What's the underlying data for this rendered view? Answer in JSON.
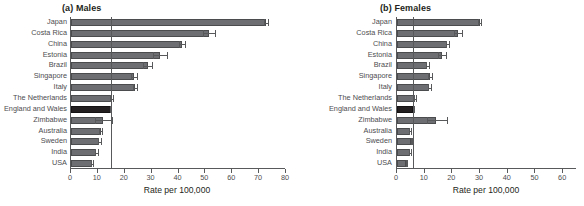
{
  "chart_data": {
    "type": "bar",
    "title": "",
    "orientation": "horizontal",
    "grid": false,
    "legend": null,
    "categories": [
      "Japan",
      "Costa Rica",
      "China",
      "Estonia",
      "Brazil",
      "Singapore",
      "Italy",
      "The Netherlands",
      "England and Wales",
      "Zimbabwe",
      "Australia",
      "Sweden",
      "India",
      "USA"
    ],
    "panels": [
      {
        "id": "a",
        "label": "(a) Males",
        "xlabel": "Rate per 100,000",
        "xlim": [
          0,
          80
        ],
        "xticks": [
          0,
          10,
          20,
          30,
          40,
          50,
          60,
          70,
          80
        ],
        "reference_line": 14.7,
        "highlight_category": "England and Wales",
        "values": [
          72.5,
          51.2,
          41.2,
          33.0,
          28.5,
          23.5,
          23.8,
          15.2,
          14.7,
          12.0,
          11.0,
          10.6,
          9.4,
          7.8
        ],
        "ci_low": [
          71.8,
          49.3,
          40.3,
          30.6,
          26.9,
          22.5,
          23.0,
          14.6,
          14.4,
          9.0,
          10.6,
          10.2,
          9.0,
          7.4
        ],
        "ci_high": [
          73.3,
          53.4,
          42.3,
          35.6,
          30.3,
          24.6,
          24.6,
          15.8,
          15.0,
          15.2,
          11.5,
          11.1,
          9.9,
          8.2
        ]
      },
      {
        "id": "b",
        "label": "(b) Females",
        "xlabel": "Rate per 100,000",
        "xlim": [
          0,
          65
        ],
        "xticks": [
          0,
          10,
          20,
          30,
          40,
          50,
          60
        ],
        "reference_line": 5.8,
        "highlight_category": "England and Wales",
        "values": [
          29.8,
          22.0,
          18.2,
          16.2,
          11.0,
          11.8,
          11.7,
          6.3,
          5.8,
          14.0,
          4.6,
          5.2,
          4.6,
          3.4
        ],
        "ci_low": [
          29.3,
          20.6,
          17.6,
          14.9,
          10.4,
          11.2,
          11.2,
          6.0,
          5.6,
          11.0,
          4.4,
          5.0,
          4.3,
          3.2
        ],
        "ci_high": [
          30.3,
          23.4,
          18.9,
          17.6,
          11.7,
          12.5,
          12.3,
          6.7,
          6.0,
          18.0,
          4.9,
          5.5,
          4.9,
          3.6
        ]
      }
    ]
  },
  "colors": {
    "bar": "#6d6e71",
    "bar_highlight": "#231f20",
    "axis": "#58595b",
    "text": "#231f20",
    "label_text": "#4d4d4f",
    "background": "#ffffff"
  }
}
